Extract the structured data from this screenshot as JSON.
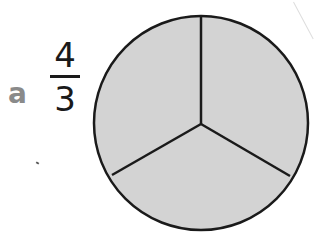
{
  "problem": {
    "label": "a",
    "fraction": {
      "numerator": "4",
      "denominator": "3"
    }
  },
  "figure": {
    "type": "circle-divided",
    "parts": 3,
    "shaded_parts": 3,
    "fill_color": "#d3d3d3",
    "stroke_color": "#1a1a1a"
  }
}
